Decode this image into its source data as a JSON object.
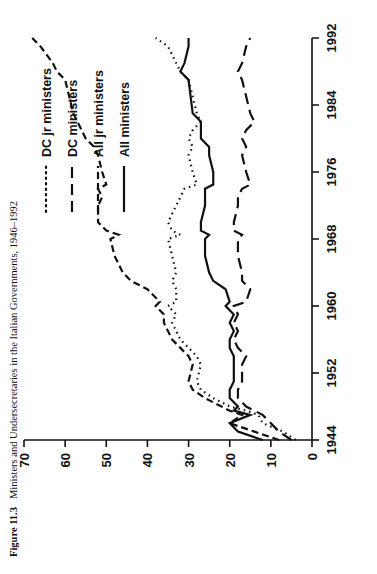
{
  "caption": {
    "figure_number": "Figure 11.3",
    "text": "Ministers and Undersecretaries in the Italian Governments, 1946–1992"
  },
  "legend": {
    "items": [
      {
        "label": "DC jr ministers",
        "style": "dotted",
        "dash": "1,4"
      },
      {
        "label": "DC ministers",
        "style": "dashed",
        "dash": "11,6"
      },
      {
        "label": "All jr ministers",
        "style": "dash-dot",
        "dash": "7,4"
      },
      {
        "label": "All ministers",
        "style": "solid",
        "dash": "none"
      }
    ]
  },
  "axes": {
    "x_label": "",
    "y_label": "",
    "x_ticks": [
      "1944",
      "1952",
      "1960",
      "1968",
      "1976",
      "1984",
      "1992"
    ],
    "y_ticks": [
      "0",
      "10",
      "20",
      "30",
      "40",
      "50",
      "60",
      "70"
    ]
  },
  "chart_data": {
    "type": "line",
    "title": "Ministers and Undersecretaries in the Italian Governments, 1946–1992",
    "xlabel": "",
    "ylabel": "",
    "xlim": [
      1944,
      1992
    ],
    "ylim": [
      0,
      70
    ],
    "grid": false,
    "legend_position": "top-right",
    "x_ticks": [
      1944,
      1952,
      1960,
      1968,
      1976,
      1984,
      1992
    ],
    "y_ticks": [
      0,
      10,
      20,
      30,
      40,
      50,
      60,
      70
    ],
    "series": [
      {
        "name": "All ministers",
        "style": "solid",
        "x": [
          1944,
          1945,
          1946,
          1947,
          1947.5,
          1948,
          1949,
          1950,
          1951,
          1953,
          1954,
          1955,
          1956,
          1957,
          1958,
          1959,
          1960,
          1960.5,
          1962,
          1963,
          1964,
          1966,
          1968,
          1968.5,
          1969,
          1970,
          1972,
          1973,
          1974,
          1974.5,
          1976,
          1978,
          1979,
          1980,
          1981,
          1982,
          1983,
          1987,
          1988,
          1989,
          1991,
          1992
        ],
        "y": [
          12,
          18,
          20,
          15,
          19,
          18,
          20,
          20,
          19,
          19,
          19,
          20,
          20,
          19,
          20,
          19,
          21,
          20,
          21,
          24,
          25,
          26,
          26,
          25,
          27,
          27,
          26,
          26,
          26,
          24,
          24,
          25,
          25,
          27,
          27,
          27,
          29,
          30,
          32,
          31,
          30,
          30
        ]
      },
      {
        "name": "All jr ministers",
        "style": "dash-dot",
        "x": [
          1944,
          1945,
          1946,
          1947,
          1947.5,
          1948,
          1949,
          1950,
          1951,
          1953,
          1954,
          1955,
          1956,
          1957,
          1958,
          1959,
          1960,
          1960.5,
          1962,
          1963,
          1964,
          1966,
          1968,
          1968.5,
          1969,
          1970,
          1972,
          1973,
          1974,
          1974.5,
          1976,
          1978,
          1979,
          1980,
          1981,
          1982,
          1983,
          1987,
          1988,
          1989,
          1991,
          1992
        ],
        "y": [
          8,
          14,
          20,
          17,
          20,
          22,
          26,
          29,
          30,
          29,
          30,
          32,
          34,
          35,
          36,
          36,
          38,
          37,
          40,
          44,
          46,
          48,
          49,
          47,
          50,
          52,
          52,
          51,
          52,
          50,
          51,
          52,
          53,
          55,
          56,
          57,
          58,
          60,
          62,
          63,
          66,
          68
        ]
      },
      {
        "name": "DC ministers",
        "style": "dashed",
        "x": [
          1944,
          1945,
          1946,
          1947,
          1947.5,
          1948,
          1949,
          1950,
          1951,
          1953,
          1954,
          1955,
          1956,
          1957,
          1958,
          1959,
          1960,
          1960.5,
          1962,
          1963,
          1964,
          1966,
          1968,
          1968.5,
          1969,
          1970,
          1972,
          1973,
          1974,
          1974.5,
          1976,
          1978,
          1979,
          1980,
          1981,
          1982,
          1983,
          1987,
          1988,
          1989,
          1991,
          1992
        ],
        "y": [
          5,
          8,
          10,
          12,
          14,
          16,
          18,
          18,
          17,
          17,
          16,
          18,
          19,
          18,
          19,
          18,
          19,
          16,
          15,
          17,
          17,
          18,
          18,
          17,
          19,
          19,
          18,
          18,
          17,
          15,
          16,
          17,
          16,
          17,
          16,
          14,
          15,
          17,
          18,
          17,
          16,
          15
        ]
      },
      {
        "name": "DC jr ministers",
        "style": "dotted",
        "x": [
          1944,
          1945,
          1946,
          1947,
          1947.5,
          1948,
          1949,
          1950,
          1951,
          1953,
          1954,
          1955,
          1956,
          1957,
          1958,
          1959,
          1960,
          1960.5,
          1962,
          1963,
          1964,
          1966,
          1968,
          1968.5,
          1969,
          1970,
          1972,
          1973,
          1974,
          1974.5,
          1976,
          1978,
          1979,
          1980,
          1981,
          1982,
          1983,
          1987,
          1988,
          1989,
          1991,
          1992
        ],
        "y": [
          4,
          7,
          12,
          13,
          16,
          20,
          24,
          27,
          28,
          27,
          28,
          30,
          32,
          33,
          34,
          33,
          35,
          33,
          33,
          34,
          33,
          34,
          35,
          32,
          34,
          35,
          33,
          32,
          31,
          28,
          29,
          30,
          29,
          30,
          29,
          27,
          28,
          30,
          32,
          33,
          35,
          38
        ]
      }
    ]
  }
}
